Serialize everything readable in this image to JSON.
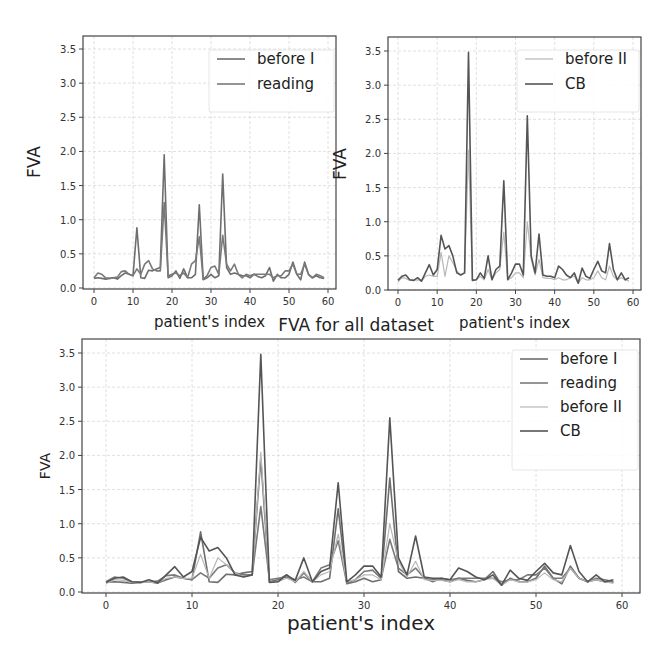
{
  "figure": {
    "subplots": [
      {
        "id": "top-left",
        "xlabel": "patient's index",
        "ylabel": "FVA",
        "legend": [
          "before I",
          "reading"
        ],
        "series_keys": [
          "before_I",
          "reading"
        ]
      },
      {
        "id": "top-right",
        "xlabel": "patient's index",
        "ylabel": "FVA",
        "legend": [
          "before II",
          "CB"
        ],
        "series_keys": [
          "before_II",
          "CB"
        ]
      },
      {
        "id": "bottom",
        "title": "FVA for all dataset",
        "xlabel": "patient's index",
        "ylabel": "FVA",
        "legend": [
          "before I",
          "reading",
          "before II",
          "CB"
        ],
        "series_keys": [
          "before_I",
          "reading",
          "before_II",
          "CB"
        ]
      }
    ],
    "x_ticks": [
      "0",
      "10",
      "20",
      "30",
      "40",
      "50",
      "60"
    ],
    "y_ticks": [
      "0.0",
      "0.5",
      "1.0",
      "1.5",
      "2.0",
      "2.5",
      "3.0",
      "3.5"
    ],
    "colors": {
      "before_I": "#6e6e6e",
      "reading": "#7a7a7a",
      "before_II": "#b8b8b8",
      "CB": "#555555",
      "grid": "#d8d8d8",
      "frame": "#444444"
    }
  },
  "chart_data": [
    {
      "type": "line",
      "title": "",
      "xlabel": "patient's index",
      "ylabel": "FVA",
      "xlim": [
        -3,
        62
      ],
      "ylim": [
        0,
        3.7
      ],
      "grid": true,
      "legend_position": "upper right",
      "x": [
        0,
        1,
        2,
        3,
        4,
        5,
        6,
        7,
        8,
        9,
        10,
        11,
        12,
        13,
        14,
        15,
        16,
        17,
        18,
        19,
        20,
        21,
        22,
        23,
        24,
        25,
        26,
        27,
        28,
        29,
        30,
        31,
        32,
        33,
        34,
        35,
        36,
        37,
        38,
        39,
        40,
        41,
        42,
        43,
        44,
        45,
        46,
        47,
        48,
        49,
        50,
        51,
        52,
        53,
        54,
        55,
        56,
        57,
        58,
        59
      ],
      "series": [
        {
          "name": "before I",
          "values": [
            0.14,
            0.15,
            0.14,
            0.13,
            0.14,
            0.15,
            0.13,
            0.18,
            0.22,
            0.2,
            0.18,
            0.88,
            0.15,
            0.14,
            0.26,
            0.25,
            0.28,
            0.3,
            1.95,
            0.15,
            0.18,
            0.25,
            0.14,
            0.28,
            0.15,
            0.15,
            0.2,
            1.22,
            0.12,
            0.15,
            0.2,
            0.15,
            0.18,
            1.67,
            0.3,
            0.2,
            0.22,
            0.2,
            0.18,
            0.18,
            0.15,
            0.2,
            0.17,
            0.15,
            0.18,
            0.3,
            0.1,
            0.2,
            0.15,
            0.15,
            0.2,
            0.38,
            0.2,
            0.12,
            0.38,
            0.2,
            0.15,
            0.18,
            0.15,
            0.14
          ]
        },
        {
          "name": "reading",
          "values": [
            0.15,
            0.22,
            0.2,
            0.15,
            0.14,
            0.15,
            0.16,
            0.24,
            0.25,
            0.2,
            0.18,
            0.28,
            0.2,
            0.35,
            0.4,
            0.28,
            0.25,
            0.25,
            1.25,
            0.18,
            0.2,
            0.22,
            0.18,
            0.22,
            0.15,
            0.35,
            0.4,
            0.75,
            0.13,
            0.18,
            0.3,
            0.32,
            0.2,
            0.77,
            0.35,
            0.25,
            0.35,
            0.2,
            0.15,
            0.2,
            0.18,
            0.2,
            0.2,
            0.2,
            0.2,
            0.2,
            0.15,
            0.18,
            0.18,
            0.25,
            0.25,
            0.35,
            0.2,
            0.2,
            0.35,
            0.2,
            0.15,
            0.2,
            0.18,
            0.15
          ]
        },
        {
          "name": "before II",
          "values": [
            0.12,
            0.18,
            0.17,
            0.14,
            0.14,
            0.15,
            0.13,
            0.2,
            0.22,
            0.2,
            0.2,
            0.55,
            0.2,
            0.5,
            0.4,
            0.28,
            0.22,
            0.25,
            2.05,
            0.15,
            0.15,
            0.2,
            0.15,
            0.3,
            0.15,
            0.25,
            0.3,
            0.85,
            0.15,
            0.18,
            0.25,
            0.25,
            0.18,
            1.0,
            0.45,
            0.22,
            0.45,
            0.18,
            0.17,
            0.17,
            0.15,
            0.18,
            0.15,
            0.15,
            0.18,
            0.2,
            0.1,
            0.18,
            0.15,
            0.15,
            0.18,
            0.28,
            0.18,
            0.15,
            0.35,
            0.2,
            0.15,
            0.18,
            0.15,
            0.13
          ]
        },
        {
          "name": "CB",
          "values": [
            0.14,
            0.2,
            0.22,
            0.15,
            0.14,
            0.18,
            0.13,
            0.25,
            0.37,
            0.22,
            0.3,
            0.8,
            0.6,
            0.65,
            0.5,
            0.25,
            0.22,
            0.25,
            3.48,
            0.14,
            0.15,
            0.25,
            0.17,
            0.5,
            0.15,
            0.3,
            0.35,
            1.6,
            0.15,
            0.25,
            0.38,
            0.38,
            0.22,
            2.55,
            0.5,
            0.25,
            0.82,
            0.22,
            0.2,
            0.2,
            0.18,
            0.35,
            0.3,
            0.22,
            0.18,
            0.25,
            0.1,
            0.32,
            0.2,
            0.17,
            0.3,
            0.42,
            0.28,
            0.25,
            0.68,
            0.3,
            0.15,
            0.25,
            0.15,
            0.18
          ]
        }
      ]
    }
  ]
}
